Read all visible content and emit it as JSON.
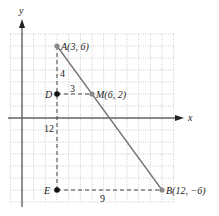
{
  "diagram": {
    "type": "coordinate-plane",
    "axes": {
      "x_label": "x",
      "y_label": "y"
    },
    "grid": {
      "x_min": -1,
      "x_max": 13,
      "y_min": -7,
      "y_max": 7,
      "step": 1
    },
    "points": [
      {
        "id": "A",
        "label": "A(3, 6)",
        "x": 3,
        "y": 6,
        "style": "gray"
      },
      {
        "id": "M",
        "label": "M(6, 2)",
        "x": 6,
        "y": 2,
        "style": "gray"
      },
      {
        "id": "B",
        "label": "B(12, −6)",
        "x": 12,
        "y": -6,
        "style": "gray"
      },
      {
        "id": "D",
        "label": "D",
        "x": 3,
        "y": 2,
        "style": "black"
      },
      {
        "id": "E",
        "label": "E",
        "x": 3,
        "y": -6,
        "style": "black"
      }
    ],
    "segments": [
      {
        "from": "A",
        "to": "B",
        "style": "solid"
      },
      {
        "from": "A",
        "to": "E",
        "style": "dashed"
      },
      {
        "from": "D",
        "to": "M",
        "style": "dashed"
      },
      {
        "from": "E",
        "to": "B",
        "style": "dashed"
      }
    ],
    "measures": [
      {
        "text": "4",
        "between": "A-D"
      },
      {
        "text": "3",
        "between": "D-M"
      },
      {
        "text": "12",
        "between": "A-E"
      },
      {
        "text": "9",
        "between": "E-B"
      }
    ],
    "colors": {
      "grid": "#bbbbbb",
      "axis": "#666666",
      "segment": "#777777",
      "gray_point": "#888888",
      "black_point": "#111111"
    }
  }
}
